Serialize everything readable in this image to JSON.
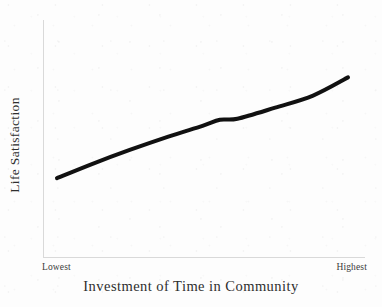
{
  "figure": {
    "background_color": "#fdfdfd",
    "axis_color": "#d9d9d9",
    "line_color": "#111111",
    "text_color": "#2e2e2e"
  },
  "axes": {
    "x_title": "Investment of Time in Community",
    "y_title": "Life Satisfaction",
    "x_tick_low": "Lowest",
    "x_tick_high": "Highest"
  },
  "chart_data": {
    "type": "line",
    "title": "",
    "subtitle": "",
    "xlabel": "Investment of Time in Community",
    "ylabel": "Life Satisfaction",
    "xlim": [
      0,
      1
    ],
    "ylim": [
      0,
      1
    ],
    "grid": false,
    "legend": null,
    "x_tick_labels": [
      "Lowest",
      "Highest"
    ],
    "x_tick_positions": [
      0,
      1
    ],
    "y_tick_labels": [],
    "series": [
      {
        "name": "Life Satisfaction",
        "color": "#111111",
        "line_width": 4,
        "style": "hand-drawn",
        "x": [
          0.0,
          0.12,
          0.25,
          0.38,
          0.5,
          0.56,
          0.62,
          0.75,
          0.88,
          1.0
        ],
        "y": [
          0.0,
          0.14,
          0.28,
          0.41,
          0.52,
          0.58,
          0.59,
          0.7,
          0.82,
          1.0
        ]
      }
    ],
    "annotations": []
  }
}
